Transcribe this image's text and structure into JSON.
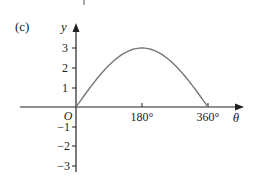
{
  "figure": {
    "part_label": "(c)",
    "y_axis_label": "y",
    "x_axis_label": "θ",
    "origin_label": "O"
  },
  "chart_data": {
    "type": "line",
    "title": "",
    "xlabel": "θ",
    "ylabel": "y",
    "function": "y = 3 sin(θ/2)",
    "x": [
      0,
      30,
      60,
      90,
      120,
      150,
      180,
      210,
      240,
      270,
      300,
      330,
      360
    ],
    "series": [
      {
        "name": "y",
        "values": [
          0,
          0.78,
          1.5,
          2.12,
          2.6,
          2.9,
          3,
          2.9,
          2.6,
          2.12,
          1.5,
          0.78,
          0
        ]
      }
    ],
    "x_ticks": [
      "180°",
      "360°"
    ],
    "y_ticks": [
      "3",
      "2",
      "1",
      "−1",
      "−2",
      "−3"
    ],
    "xlim": [
      0,
      360
    ],
    "ylim": [
      -3,
      3
    ],
    "grid": false,
    "legend": null,
    "line_color": "#777777",
    "axis_color": "#222222"
  }
}
